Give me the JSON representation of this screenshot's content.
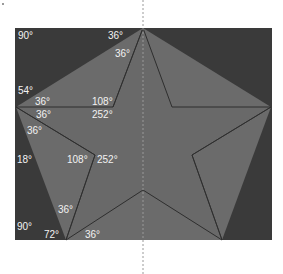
{
  "diagram": {
    "colors": {
      "background": "#ffffff",
      "frame": "#3a3a3a",
      "pentagon_fill": "#6b6b6b",
      "star_fill": "#696969",
      "edge": "#2e2e2e",
      "label": "#f2f2f2",
      "axis": "#9a9a9a"
    },
    "frame": {
      "x": 15,
      "y": 28,
      "width": 257,
      "height": 212
    },
    "outer_vertices": {
      "top": [
        143,
        28
      ],
      "right": [
        271,
        107
      ],
      "bottom_right": [
        222,
        240
      ],
      "bottom_left": [
        66,
        240
      ],
      "left": [
        16,
        107
      ]
    },
    "inner_vertices": {
      "upper_left": [
        113,
        107
      ],
      "upper_right": [
        172,
        107
      ],
      "lower_right": [
        192,
        155
      ],
      "bottom": [
        143,
        190
      ],
      "lower_left": [
        95,
        155
      ]
    },
    "symmetry_axis": {
      "x": 143,
      "style": "dotted"
    },
    "labels": [
      {
        "text": "90°",
        "x": 18,
        "y": 31
      },
      {
        "text": "36°",
        "x": 108,
        "y": 31
      },
      {
        "text": "36°",
        "x": 115,
        "y": 49
      },
      {
        "text": "54°",
        "x": 18,
        "y": 86
      },
      {
        "text": "36°",
        "x": 35,
        "y": 97
      },
      {
        "text": "108°",
        "x": 92,
        "y": 97
      },
      {
        "text": "36°",
        "x": 36,
        "y": 110
      },
      {
        "text": "252°",
        "x": 92,
        "y": 110
      },
      {
        "text": "36°",
        "x": 27,
        "y": 126
      },
      {
        "text": "18°",
        "x": 17,
        "y": 155
      },
      {
        "text": "108°",
        "x": 67,
        "y": 155
      },
      {
        "text": "252°",
        "x": 97,
        "y": 155
      },
      {
        "text": "36°",
        "x": 58,
        "y": 205
      },
      {
        "text": "90°",
        "x": 17,
        "y": 222
      },
      {
        "text": "72°",
        "x": 44,
        "y": 230
      },
      {
        "text": "36°",
        "x": 85,
        "y": 230
      }
    ]
  }
}
